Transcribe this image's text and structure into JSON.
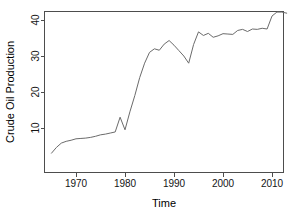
{
  "chart_data": {
    "type": "line",
    "title": "",
    "xlabel": "Time",
    "ylabel": "Crude Oil Production",
    "xlim": [
      1964,
      2014
    ],
    "ylim": [
      0,
      44
    ],
    "xticks": [
      1970,
      1980,
      1990,
      2000,
      2010
    ],
    "yticks": [
      10,
      20,
      30,
      40
    ],
    "xtick_labels": [
      "1970",
      "1980",
      "1990",
      "2000",
      "2010"
    ],
    "ytick_labels": [
      "10",
      "20",
      "30",
      "40"
    ],
    "grid": false,
    "legend": "none",
    "box": "open-bottom-left",
    "series": [
      {
        "name": "Crude Oil Production",
        "color": "#6b6b6b",
        "x": [
          1965,
          1966,
          1967,
          1968,
          1969,
          1970,
          1971,
          1972,
          1973,
          1974,
          1975,
          1976,
          1977,
          1978,
          1979,
          1980,
          1981,
          1982,
          1983,
          1984,
          1985,
          1986,
          1987,
          1988,
          1989,
          1990,
          1991,
          1992,
          1993,
          1994,
          1995,
          1996,
          1997,
          1998,
          1999,
          2000,
          2001,
          2002,
          2003,
          2004,
          2005,
          2006,
          2007,
          2008,
          2009,
          2010,
          2011,
          2012,
          2013
        ],
        "y": [
          3.0,
          4.6,
          5.8,
          6.3,
          6.6,
          7.0,
          7.1,
          7.2,
          7.4,
          7.7,
          8.1,
          8.3,
          8.6,
          8.9,
          13.0,
          9.5,
          14.5,
          19.0,
          24.0,
          28.0,
          31.0,
          32.0,
          31.6,
          33.3,
          34.3,
          33.0,
          31.5,
          30.0,
          28.0,
          33.2,
          36.7,
          35.7,
          36.3,
          35.2,
          35.6,
          36.2,
          36.1,
          36.0,
          37.1,
          37.4,
          36.8,
          37.5,
          37.4,
          37.7,
          37.5,
          41.1,
          42.2,
          42.2,
          41.9
        ]
      }
    ]
  },
  "axis": {
    "y_title": "Crude Oil Production",
    "x_title": "Time"
  }
}
